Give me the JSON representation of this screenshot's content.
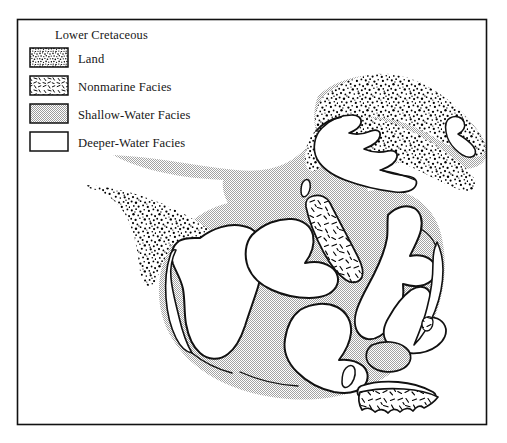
{
  "figure": {
    "kind": "paleogeographic-facies-map",
    "frame": {
      "x": 17,
      "y": 19,
      "width": 470,
      "height": 406
    }
  },
  "legend": {
    "title": "Lower Cretaceous",
    "items": [
      {
        "label": "Land",
        "pattern": "dense-stipple",
        "color": "#000000"
      },
      {
        "label": "Nonmarine Facies",
        "pattern": "sparse-dashes",
        "color": "#000000"
      },
      {
        "label": "Shallow-Water Facies",
        "pattern": "gray-halftone",
        "color": "#c6c6c6"
      },
      {
        "label": "Deeper-Water Facies",
        "pattern": "blank-white",
        "color": "#ffffff"
      }
    ]
  },
  "map": {
    "regions": [
      {
        "name": "shallow-water-sea",
        "facies": "Shallow-Water Facies"
      },
      {
        "name": "northeast-landmass",
        "facies": "Land"
      },
      {
        "name": "west-landmass",
        "facies": "Land"
      },
      {
        "name": "central-nonmarine-belt",
        "facies": "Nonmarine Facies"
      },
      {
        "name": "south-nonmarine-patch",
        "facies": "Nonmarine Facies"
      },
      {
        "name": "deeper-water-basins",
        "facies": "Deeper-Water Facies"
      }
    ]
  }
}
